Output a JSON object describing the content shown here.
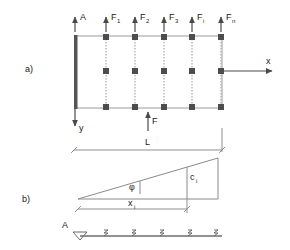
{
  "figure": {
    "panels": [
      {
        "id": "a",
        "label": "a)"
      },
      {
        "id": "b",
        "label": "b)"
      }
    ]
  },
  "panel_a": {
    "panel_label": "a)",
    "top_loads": [
      {
        "name": "A",
        "base": "A",
        "sub": ""
      },
      {
        "name": "F1",
        "base": "F",
        "sub": "1"
      },
      {
        "name": "F2",
        "base": "F",
        "sub": "2"
      },
      {
        "name": "F3",
        "base": "F",
        "sub": "3"
      },
      {
        "name": "Fi",
        "base": "F",
        "sub": "i"
      },
      {
        "name": "Fn",
        "base": "F",
        "sub": "n"
      }
    ],
    "bottom_load": {
      "name": "F",
      "base": "F",
      "sub": ""
    },
    "axes": {
      "x_label": "x",
      "y_label": "y"
    },
    "columns": 5,
    "wall": "fixed-support-wall"
  },
  "dimensions": {
    "length": {
      "label": "L",
      "base": "L",
      "sub": ""
    },
    "xi": {
      "label": "xi",
      "base": "x",
      "sub": "i"
    }
  },
  "panel_b": {
    "panel_label": "b)",
    "angle": {
      "label": "phi",
      "glyph": "φ"
    },
    "height": {
      "label": "ci",
      "base": "c",
      "sub": "i"
    },
    "support_label": "A",
    "support_symbol": "pin-support-triangle",
    "hatch_count": 5
  },
  "colors": {
    "background": "#ffffff",
    "ink": "#1a1a1a",
    "line": "#8f8f8f",
    "node": "#4d4d4d",
    "wall": "#545454",
    "dash": "#bdbdbd",
    "arrow": "#4a4a4a"
  }
}
